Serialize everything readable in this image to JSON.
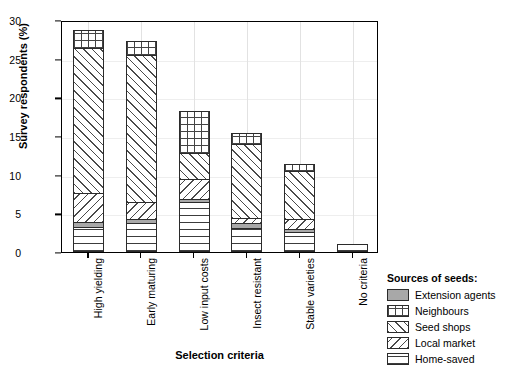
{
  "chart_data": {
    "type": "bar",
    "subtype": "stacked-bar",
    "title": "",
    "xlabel": "Selection criteria",
    "ylabel": "Survey respondents (%)",
    "ylim": [
      0,
      30
    ],
    "yticks": [
      0,
      5,
      10,
      15,
      20,
      25,
      30
    ],
    "grid": true,
    "legend_position": "right-bottom-outside",
    "annotation": "N=550",
    "categories": [
      "High yielding",
      "Early maturing",
      "Low input costs",
      "Insect resistant",
      "Stable varieties",
      "No criteria"
    ],
    "series": [
      {
        "name": "Home-saved",
        "pattern": "horizontal-lines",
        "values": [
          3.1,
          3.6,
          6.3,
          3.0,
          2.4,
          0.9
        ]
      },
      {
        "name": "Extension agents",
        "pattern": "solid-gray",
        "values": [
          0.6,
          0.5,
          0.4,
          0.6,
          0.4,
          0.0
        ]
      },
      {
        "name": "Local market",
        "pattern": "back-diagonal-hatch",
        "values": [
          3.8,
          2.2,
          2.6,
          0.7,
          1.3,
          0.0
        ]
      },
      {
        "name": "Seed shops",
        "pattern": "fwd-diagonal-hatch",
        "values": [
          18.8,
          19.1,
          3.4,
          9.5,
          6.3,
          0.0
        ]
      },
      {
        "name": "Neighbours",
        "pattern": "grid-crosshatch",
        "values": [
          2.3,
          1.8,
          5.4,
          1.5,
          0.9,
          0.0
        ]
      }
    ],
    "totals": [
      28.6,
      27.2,
      18.1,
      15.3,
      11.3,
      0.9
    ]
  },
  "legend": {
    "title": "Sources of seeds:",
    "items": [
      {
        "label": "Extension agents",
        "pattern": "pat-extension"
      },
      {
        "label": "Neighbours",
        "pattern": "pat-neighbours"
      },
      {
        "label": "Seed shops",
        "pattern": "pat-seedshops"
      },
      {
        "label": "Local market",
        "pattern": "pat-localmarket"
      },
      {
        "label": "Home-saved",
        "pattern": "pat-homesaved"
      }
    ]
  },
  "colors": {
    "axis": "#000000",
    "grid": "#e2e2e2",
    "extension_agents_fill": "#a8a8a8",
    "pattern_stroke": "#444444",
    "background": "#ffffff"
  }
}
